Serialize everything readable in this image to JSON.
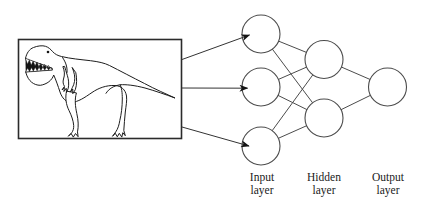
{
  "figure": {
    "type": "neural-network-diagram",
    "background_color": "#ffffff",
    "line_color": "#4c4c4c",
    "ink_color": "#141414"
  },
  "input_image": {
    "description": "Line drawing of a cartoon Tyrannosaurus rex inside a rectangular frame"
  },
  "labels": {
    "input": "Input\nlayer",
    "hidden": "Hidden\nlayer",
    "output": "Output\nlayer"
  },
  "network": {
    "node_radius": 19,
    "layers": [
      {
        "id": "input-layer",
        "count": 3,
        "nodes": [
          {
            "x": 261,
            "y": 34
          },
          {
            "x": 261,
            "y": 87
          },
          {
            "x": 261,
            "y": 146
          }
        ]
      },
      {
        "id": "hidden-layer",
        "count": 2,
        "nodes": [
          {
            "x": 324,
            "y": 59.5
          },
          {
            "x": 324,
            "y": 118
          }
        ]
      },
      {
        "id": "output-layer",
        "count": 1,
        "nodes": [
          {
            "x": 387.5,
            "y": 87
          }
        ]
      }
    ],
    "edges": [
      [
        0,
        0,
        1,
        0
      ],
      [
        0,
        0,
        1,
        1
      ],
      [
        0,
        1,
        1,
        0
      ],
      [
        0,
        1,
        1,
        1
      ],
      [
        0,
        2,
        1,
        0
      ],
      [
        0,
        2,
        1,
        1
      ],
      [
        1,
        0,
        2,
        0
      ],
      [
        1,
        1,
        2,
        0
      ]
    ],
    "arrows": [
      {
        "x1": 182,
        "y1": 59.5,
        "x2": 249.5,
        "y2": 35
      },
      {
        "x1": 182,
        "y1": 88,
        "x2": 247.5,
        "y2": 88.2
      },
      {
        "x1": 182,
        "y1": 127,
        "x2": 249,
        "y2": 146
      }
    ]
  }
}
